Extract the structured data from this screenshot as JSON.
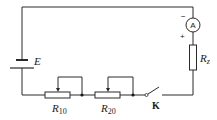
{
  "diagram": {
    "type": "circuit",
    "components": {
      "battery": {
        "label": "E"
      },
      "rheostat_1": {
        "label_main": "R",
        "label_sub": "10"
      },
      "rheostat_2": {
        "label_main": "R",
        "label_sub": "20"
      },
      "switch": {
        "label": "K",
        "state": "open"
      },
      "ammeter": {
        "symbol": "A",
        "minus_sign": "−",
        "plus_sign": "+"
      },
      "resistor": {
        "label_main": "R",
        "label_sub": "z"
      }
    },
    "connection_order": [
      "E",
      "R10",
      "R20",
      "K",
      "Rz",
      "A"
    ]
  }
}
